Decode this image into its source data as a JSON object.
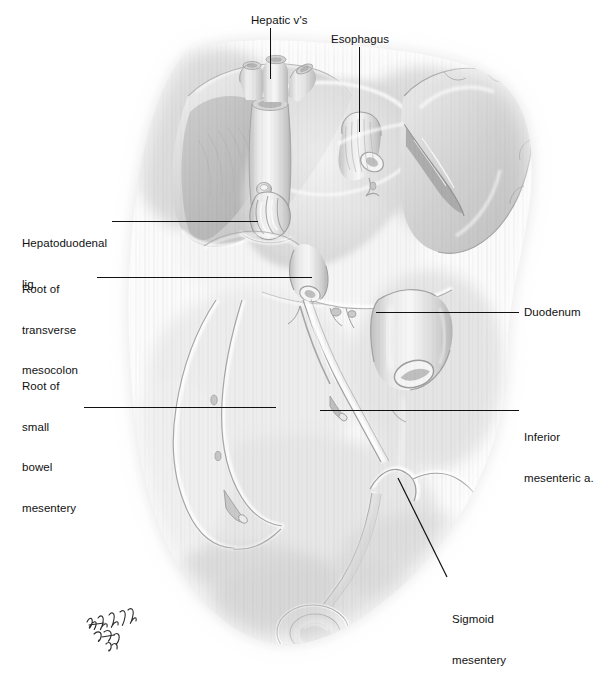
{
  "figure": {
    "medium": "grayscale airbrush and pencil medical illustration",
    "background_color": "#ffffff",
    "ink_color": "#111111",
    "width": 610,
    "height": 699
  },
  "labels": [
    {
      "id": "hepatic-veins",
      "text": "Hepatic v's",
      "lines": [
        "Hepatic v's"
      ],
      "x": 251,
      "y": 14,
      "align": "left",
      "leader": {
        "type": "vertical",
        "x": 270,
        "y1": 28,
        "y2": 79
      }
    },
    {
      "id": "esophagus",
      "text": "Esophagus",
      "lines": [
        "Esophagus"
      ],
      "x": 331,
      "y": 33,
      "align": "left",
      "leader": {
        "type": "vertical",
        "x": 359,
        "y1": 47,
        "y2": 132
      }
    },
    {
      "id": "hepatoduodenal-ligament",
      "text": "Hepatoduodenal lig.",
      "lines": [
        "Hepatoduodenal",
        "lig."
      ],
      "x": 22,
      "y": 210,
      "align": "left",
      "leader": {
        "type": "horizontal",
        "x1": 112,
        "x2": 258,
        "y": 221
      }
    },
    {
      "id": "root-of-transverse-mesocolon",
      "text": "Root of transverse mesocolon",
      "lines": [
        "Root of",
        "transverse",
        "mesocolon"
      ],
      "x": 22,
      "y": 256,
      "align": "left",
      "leader": {
        "type": "horizontal",
        "x1": 97,
        "x2": 312,
        "y": 277
      }
    },
    {
      "id": "root-of-small-bowel-mesentery",
      "text": "Root of small bowel mesentery",
      "lines": [
        "Root of",
        "small",
        "bowel",
        "mesentery"
      ],
      "x": 22,
      "y": 353,
      "align": "left",
      "leader": {
        "type": "horizontal",
        "x1": 84,
        "x2": 276,
        "y": 407
      }
    },
    {
      "id": "duodenum",
      "text": "Duodenum",
      "lines": [
        "Duodenum"
      ],
      "x": 524,
      "y": 306,
      "align": "left",
      "leader": {
        "type": "horizontal",
        "x1": 376,
        "x2": 519,
        "y": 312
      }
    },
    {
      "id": "inferior-mesenteric-artery",
      "text": "Inferior mesenteric a.",
      "lines": [
        "Inferior",
        "mesenteric a."
      ],
      "x": 524,
      "y": 404,
      "align": "left",
      "leader": {
        "type": "horizontal",
        "x1": 320,
        "x2": 519,
        "y": 410
      }
    },
    {
      "id": "sigmoid-mesentery",
      "text": "Sigmoid mesentery",
      "lines": [
        "Sigmoid",
        "mesentery"
      ],
      "x": 452,
      "y": 586,
      "align": "left",
      "leader": {
        "type": "diagonal",
        "x1": 398,
        "y1": 478,
        "x2": 447,
        "y2": 577
      }
    }
  ],
  "signature": {
    "present": true,
    "description": "handwritten artist signature",
    "text": ""
  },
  "structures": [
    {
      "id": "liver-bare-area",
      "name": "Liver / bare area of diaphragm"
    },
    {
      "id": "inferior-vena-cava",
      "name": "Inferior vena cava"
    },
    {
      "id": "hepatic-veins-stumps",
      "name": "Hepatic vein stumps"
    },
    {
      "id": "esophageal-hiatus",
      "name": "Esophagus at hiatus"
    },
    {
      "id": "spleen",
      "name": "Spleen"
    },
    {
      "id": "splenic-hilum",
      "name": "Splenic hilum vessels"
    },
    {
      "id": "hepatoduodenal-ligament-cut",
      "name": "Cut hepatoduodenal ligament (portal triad)"
    },
    {
      "id": "transverse-mesocolon-root",
      "name": "Root of transverse mesocolon"
    },
    {
      "id": "duodenum-loop",
      "name": "Duodenum"
    },
    {
      "id": "small-bowel-mesentery-root",
      "name": "Root of small bowel mesentery"
    },
    {
      "id": "inferior-mesenteric-artery-vessel",
      "name": "Inferior mesenteric artery"
    },
    {
      "id": "sigmoid-mesocolon",
      "name": "Sigmoid mesentery"
    },
    {
      "id": "rectal-stump",
      "name": "Rectal stump"
    }
  ]
}
